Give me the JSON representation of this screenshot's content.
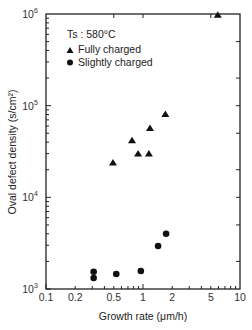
{
  "chart_data": {
    "type": "scatter",
    "title": "",
    "xlabel": "Growth rate (μm/h)",
    "ylabel": "Oval defect density (s/cm²)",
    "xscale": "log",
    "yscale": "log",
    "xlim": [
      0.1,
      10
    ],
    "ylim": [
      1000,
      1000000
    ],
    "grid": false,
    "x_tick_labels": [
      "0.1",
      "0.2",
      "0.5",
      "1",
      "2",
      "5",
      "10"
    ],
    "x_tick_values": [
      0.1,
      0.2,
      0.5,
      1,
      2,
      5,
      10
    ],
    "y_tick_labels": [
      {
        "base": "10",
        "exp": "3",
        "value": 1000
      },
      {
        "base": "10",
        "exp": "4",
        "value": 10000
      },
      {
        "base": "10",
        "exp": "5",
        "value": 100000
      },
      {
        "base": "10",
        "exp": "6",
        "value": 1000000
      }
    ],
    "annotation": "Ts : 580°C",
    "legend_position": "upper left",
    "series": [
      {
        "name": "Fully charged",
        "marker": "triangle",
        "color": "#111111",
        "points": [
          {
            "x": 0.49,
            "y": 24000
          },
          {
            "x": 0.77,
            "y": 42000
          },
          {
            "x": 0.89,
            "y": 30000
          },
          {
            "x": 1.15,
            "y": 30000
          },
          {
            "x": 1.18,
            "y": 57000
          },
          {
            "x": 1.7,
            "y": 81000
          },
          {
            "x": 5.9,
            "y": 980000
          }
        ]
      },
      {
        "name": "Slightly charged",
        "marker": "circle",
        "color": "#111111",
        "points": [
          {
            "x": 0.31,
            "y": 1540
          },
          {
            "x": 0.31,
            "y": 1320
          },
          {
            "x": 0.53,
            "y": 1460
          },
          {
            "x": 0.95,
            "y": 1570
          },
          {
            "x": 1.43,
            "y": 2950
          },
          {
            "x": 1.73,
            "y": 4000
          }
        ]
      }
    ]
  }
}
